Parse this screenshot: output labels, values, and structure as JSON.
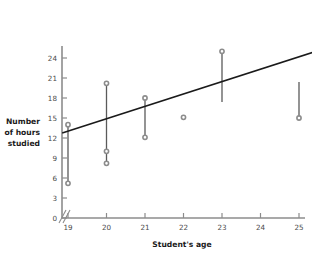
{
  "chart_data": {
    "type": "scatter",
    "title": "",
    "xlabel": "Student's age",
    "ylabel": "Number of hours studied",
    "ylabel_lines": [
      "Number",
      "of hours",
      "studied"
    ],
    "xlim": [
      18.7,
      25.6
    ],
    "ylim": [
      0,
      25.8
    ],
    "xticks": [
      19,
      20,
      21,
      22,
      23,
      24,
      25
    ],
    "xtick_labels": [
      "19",
      "20",
      "21",
      "22",
      "23",
      "24",
      "25"
    ],
    "yticks": [
      0,
      3,
      6,
      9,
      12,
      15,
      18,
      21,
      24
    ],
    "ytick_labels": [
      "0",
      "3",
      "6",
      "9",
      "12",
      "15",
      "18",
      "21",
      "24"
    ],
    "grid": false,
    "legend": "none",
    "axis_break": true,
    "points": [
      {
        "x": 19,
        "y": 14.0
      },
      {
        "x": 19,
        "y": 5.2
      },
      {
        "x": 20,
        "y": 20.2
      },
      {
        "x": 20,
        "y": 10.0
      },
      {
        "x": 20,
        "y": 8.2
      },
      {
        "x": 21,
        "y": 18.0
      },
      {
        "x": 21,
        "y": 12.1
      },
      {
        "x": 22,
        "y": 15.1
      },
      {
        "x": 23,
        "y": 25.0
      },
      {
        "x": 25,
        "y": 15.0
      }
    ],
    "residual_segments": [
      {
        "x": 19,
        "y_top": 14.0,
        "y_bottom": 5.2
      },
      {
        "x": 20,
        "y_top": 20.2,
        "y_bottom": 8.2
      },
      {
        "x": 21,
        "y_top": 18.0,
        "y_bottom": 12.1
      },
      {
        "x": 22,
        "y_top": 15.4,
        "y_bottom": 15.1
      },
      {
        "x": 23,
        "y_top": 25.0,
        "y_bottom": 17.4
      },
      {
        "x": 25,
        "y_top": 20.4,
        "y_bottom": 15.0
      }
    ],
    "trend_line": {
      "x_start": 18.85,
      "y_start": 12.75,
      "x_end": 25.55,
      "y_end": 25.2,
      "slope": 1.858,
      "intercept": -22.28
    },
    "colors": {
      "marker": "#8c8c8c",
      "segment": "#5a5a5a",
      "trend_line": "#1a1a1a",
      "axis": "#8c8c8c",
      "tick_label": "#4a4a4a",
      "axis_title": "#1a1a1a",
      "background": "#ffffff"
    }
  }
}
